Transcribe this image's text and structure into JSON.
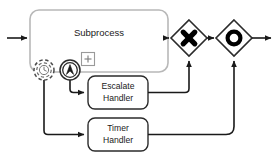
{
  "diagram": {
    "type": "bpmn-process-diagram",
    "canvas": {
      "width": 279,
      "height": 161,
      "background": "#ffffff"
    },
    "colors": {
      "stroke": "#3d3d3d",
      "subprocess_stroke": "#b5b5b5",
      "task_stroke": "#2b2b2b",
      "gateway_stroke": "#2b2b2b",
      "marker_fill": "#000000",
      "text": "#1a1a1a",
      "fill": "#ffffff"
    }
  },
  "shapes": {
    "subprocess": {
      "label": "Subprocess",
      "marker": "+",
      "marker_name": "expand-collapse-marker",
      "x": 30,
      "y": 10,
      "w": 138,
      "h": 62,
      "rx": 9
    },
    "escalate_handler": {
      "label_line1": "Escalate",
      "label_line2": "Handler",
      "x": 88,
      "y": 76,
      "w": 60,
      "h": 33,
      "rx": 7
    },
    "timer_handler": {
      "label_line1": "Timer",
      "label_line2": "Handler",
      "x": 88,
      "y": 118,
      "w": 60,
      "h": 33,
      "rx": 7
    }
  },
  "boundary_events": [
    {
      "id": "timer-boundary-event",
      "icon": "clock-icon",
      "interrupting": false,
      "border_style": "dashed-double-circle",
      "cx": 44,
      "cy": 70,
      "r": 10
    },
    {
      "id": "escalation-boundary-event",
      "icon": "escalation-arrow-icon",
      "interrupting": false,
      "border_style": "solid-double-circle",
      "cx": 70,
      "cy": 70,
      "r": 10
    }
  ],
  "gateways": [
    {
      "id": "exclusive-gateway",
      "marker": "X",
      "marker_name": "exclusive-x-marker",
      "cx": 189,
      "cy": 38,
      "half": 18
    },
    {
      "id": "event-gateway",
      "marker": "O",
      "marker_name": "event-circle-marker",
      "cx": 234,
      "cy": 38,
      "half": 18
    }
  ],
  "flows": [
    {
      "id": "start-into-subprocess",
      "from": "start",
      "to": "subprocess"
    },
    {
      "id": "subprocess-to-exclusive-gateway",
      "from": "subprocess",
      "to": "exclusive-gateway"
    },
    {
      "id": "exclusive-to-event-gateway",
      "from": "exclusive-gateway",
      "to": "event-gateway"
    },
    {
      "id": "event-gateway-to-end",
      "from": "event-gateway",
      "to": "end"
    },
    {
      "id": "escalation-event-to-escalate-handler",
      "from": "escalation-boundary-event",
      "to": "escalate_handler"
    },
    {
      "id": "timer-event-to-timer-handler",
      "from": "timer-boundary-event",
      "to": "timer_handler"
    },
    {
      "id": "escalate-handler-to-exclusive-gateway",
      "from": "escalate_handler",
      "to": "exclusive-gateway"
    },
    {
      "id": "timer-handler-to-event-gateway",
      "from": "timer_handler",
      "to": "event-gateway"
    }
  ]
}
